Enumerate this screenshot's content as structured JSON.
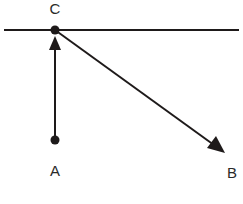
{
  "diagram": {
    "type": "vector-diagram",
    "points": [
      {
        "id": "C",
        "label": "C"
      },
      {
        "id": "A",
        "label": "A"
      },
      {
        "id": "B",
        "label": "B"
      }
    ],
    "lines": [
      {
        "id": "horizontal-line",
        "through": "C",
        "description": "horizontal line through C"
      }
    ],
    "arrows": [
      {
        "id": "arrow-A-to-C",
        "from": "A",
        "to": "C"
      },
      {
        "id": "arrow-C-to-B",
        "from": "C",
        "to": "B"
      }
    ],
    "colors": {
      "stroke": "#1e1a1a",
      "label": "#2a2a2a",
      "background": "#ffffff"
    }
  }
}
